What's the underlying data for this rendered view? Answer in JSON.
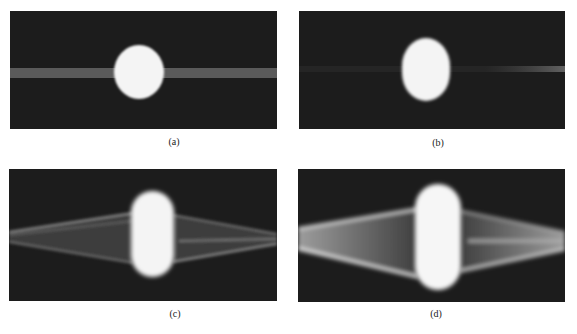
{
  "figure": {
    "panels": [
      {
        "id": "a",
        "label": "(a)",
        "description": "Spherical droplet with horizontal beam passing behind it"
      },
      {
        "id": "b",
        "label": "(b)",
        "description": "Slightly elongated droplet, faint beam"
      },
      {
        "id": "c",
        "label": "(c)",
        "description": "Elongated capsule-shaped droplet with diverging light fan"
      },
      {
        "id": "d",
        "label": "(d)",
        "description": "Highly elongated capsule-shaped droplet with bright diverging light fan"
      }
    ]
  },
  "colors": {
    "background": "#1c1c1c",
    "droplet": "#f4f4f4",
    "beam": "#5a5a5a"
  }
}
